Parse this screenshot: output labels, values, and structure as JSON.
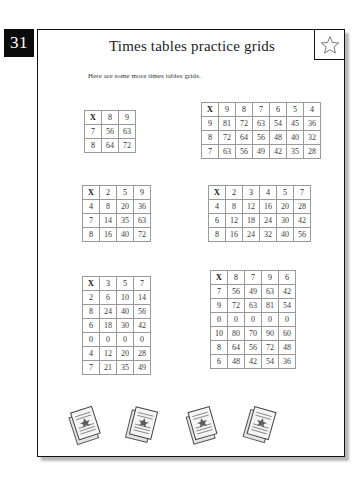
{
  "page": {
    "number": "31",
    "title": "Times tables practice grids",
    "subtitle": "Here are some more times tables grids.",
    "star_icon": "star-icon"
  },
  "grids": [
    {
      "id": "grid-1",
      "corner": "X",
      "columns": [
        "8",
        "9"
      ],
      "rows": [
        {
          "label": "7",
          "values": [
            "56",
            "63"
          ]
        },
        {
          "label": "8",
          "values": [
            "64",
            "72"
          ]
        }
      ]
    },
    {
      "id": "grid-2",
      "corner": "X",
      "columns": [
        "9",
        "8",
        "7",
        "6",
        "5",
        "4"
      ],
      "rows": [
        {
          "label": "9",
          "values": [
            "81",
            "72",
            "63",
            "54",
            "45",
            "36"
          ]
        },
        {
          "label": "8",
          "values": [
            "72",
            "64",
            "56",
            "48",
            "40",
            "32"
          ]
        },
        {
          "label": "7",
          "values": [
            "63",
            "56",
            "49",
            "42",
            "35",
            "28"
          ]
        }
      ]
    },
    {
      "id": "grid-3",
      "corner": "X",
      "columns": [
        "2",
        "5",
        "9"
      ],
      "rows": [
        {
          "label": "4",
          "values": [
            "8",
            "20",
            "36"
          ]
        },
        {
          "label": "7",
          "values": [
            "14",
            "35",
            "63"
          ]
        },
        {
          "label": "8",
          "values": [
            "16",
            "40",
            "72"
          ]
        }
      ]
    },
    {
      "id": "grid-4",
      "corner": "X",
      "columns": [
        "2",
        "3",
        "4",
        "5",
        "7"
      ],
      "rows": [
        {
          "label": "4",
          "values": [
            "8",
            "12",
            "16",
            "20",
            "28"
          ]
        },
        {
          "label": "6",
          "values": [
            "12",
            "18",
            "24",
            "30",
            "42"
          ]
        },
        {
          "label": "8",
          "values": [
            "16",
            "24",
            "32",
            "40",
            "56"
          ]
        }
      ]
    },
    {
      "id": "grid-5",
      "corner": "X",
      "columns": [
        "3",
        "5",
        "7"
      ],
      "rows": [
        {
          "label": "2",
          "values": [
            "6",
            "10",
            "14"
          ]
        },
        {
          "label": "8",
          "values": [
            "24",
            "40",
            "56"
          ]
        },
        {
          "label": "6",
          "values": [
            "18",
            "30",
            "42"
          ]
        },
        {
          "label": "0",
          "values": [
            "0",
            "0",
            "0"
          ]
        },
        {
          "label": "4",
          "values": [
            "12",
            "20",
            "28"
          ]
        },
        {
          "label": "7",
          "values": [
            "21",
            "35",
            "49"
          ]
        }
      ]
    },
    {
      "id": "grid-6",
      "corner": "X",
      "columns": [
        "8",
        "7",
        "9",
        "6"
      ],
      "rows": [
        {
          "label": "7",
          "values": [
            "56",
            "49",
            "63",
            "42"
          ]
        },
        {
          "label": "9",
          "values": [
            "72",
            "63",
            "81",
            "54"
          ]
        },
        {
          "label": "0",
          "values": [
            "0",
            "0",
            "0",
            "0"
          ]
        },
        {
          "label": "10",
          "values": [
            "80",
            "70",
            "90",
            "60"
          ]
        },
        {
          "label": "8",
          "values": [
            "64",
            "56",
            "72",
            "48"
          ]
        },
        {
          "label": "6",
          "values": [
            "48",
            "42",
            "54",
            "36"
          ]
        }
      ]
    }
  ],
  "decorations": [
    {
      "name": "stacked-papers-icon"
    },
    {
      "name": "stacked-papers-icon"
    },
    {
      "name": "stacked-papers-icon"
    },
    {
      "name": "stacked-papers-icon"
    }
  ]
}
